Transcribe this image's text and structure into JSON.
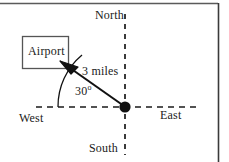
{
  "figure": {
    "compass": {
      "north_label": "North",
      "south_label": "South",
      "west_label": "West",
      "east_label": "East"
    },
    "origin": {
      "name": "origin-point",
      "x": 125,
      "y": 107
    },
    "destination_box": {
      "label": "Airport",
      "x": 22,
      "y": 36,
      "width": 46,
      "height": 32
    },
    "vector": {
      "distance_label": "3 miles",
      "distance_value": 3,
      "distance_unit": "miles",
      "angle_label": "30",
      "angle_degree_symbol": "o",
      "angle_value": 30,
      "angle_unit": "degrees",
      "measured_from": "West",
      "from_x": 125,
      "from_y": 107,
      "to_x": 61,
      "to_y": 62
    },
    "colors": {
      "stroke": "#111111",
      "axis_dash": "#1a1a1a",
      "box_stroke": "#555555",
      "frame": "#3a3a3a",
      "background": "#ffffff"
    }
  }
}
